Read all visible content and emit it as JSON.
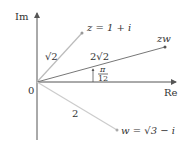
{
  "diagram": {
    "type": "complex-plane",
    "axes": {
      "horizontal_label": "Re",
      "vertical_label": "Im",
      "origin_label": "0"
    },
    "points": [
      {
        "id": "z",
        "label": "z = 1 + i",
        "modulus_label": "√2"
      },
      {
        "id": "zw",
        "label": "zw",
        "modulus_label": "2√2"
      },
      {
        "id": "w",
        "label": "w = √3 − i",
        "modulus_label": "2"
      }
    ],
    "angle": {
      "numerator": "π",
      "denominator": "12"
    },
    "colors": {
      "axis": "#555555",
      "vector_z": "#bbbbbb",
      "vector_zw": "#777777",
      "vector_w": "#cccccc",
      "text": "#333333"
    }
  }
}
